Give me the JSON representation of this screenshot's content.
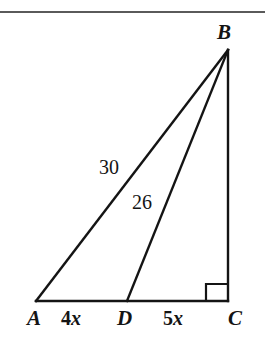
{
  "figure": {
    "type": "geometry-diagram",
    "background_color": "#ffffff",
    "stroke_color": "#141414",
    "rule_color": "#5a5a5a",
    "vertices": {
      "A": {
        "label": "A",
        "x": 36,
        "y": 301
      },
      "B": {
        "label": "B",
        "x": 228,
        "y": 50
      },
      "C": {
        "label": "C",
        "x": 228,
        "y": 301
      },
      "D": {
        "label": "D",
        "x": 127,
        "y": 301
      }
    },
    "segments": [
      {
        "name": "AB",
        "from": "A",
        "to": "B",
        "length_label": "30"
      },
      {
        "name": "DB",
        "from": "D",
        "to": "B",
        "length_label": "26"
      },
      {
        "name": "BC",
        "from": "B",
        "to": "C",
        "length_label": ""
      },
      {
        "name": "AC",
        "from": "A",
        "to": "C",
        "length_label": ""
      }
    ],
    "length_labels": {
      "AB": "30",
      "DB": "26"
    },
    "base_segment_labels": {
      "AD": {
        "coefficient": "4",
        "variable": "x",
        "text": "4x"
      },
      "DC": {
        "coefficient": "5",
        "variable": "x",
        "text": "5x"
      }
    },
    "right_angle": {
      "at_vertex": "C",
      "marker": "right-angle-square",
      "x": 206,
      "y": 284,
      "size": 16
    }
  }
}
